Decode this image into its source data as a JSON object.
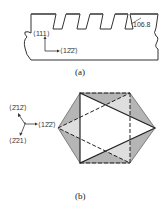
{
  "figure_a": {
    "caption": "(a)",
    "labels": {
      "dir_111": "⟨111⟩",
      "dir_122": "⟨12̄2̄⟩",
      "angle": "106.8"
    }
  },
  "figure_b": {
    "caption": "(b)",
    "labels": {
      "dir_212": "⟨2̄12̄⟩",
      "dir_122": "⟨12̄2̄⟩",
      "dir_221": "⟨2̄21⟩"
    }
  },
  "colors": {
    "line": "#333333",
    "shade": "#b5b5b5",
    "background": "#ffffff"
  }
}
